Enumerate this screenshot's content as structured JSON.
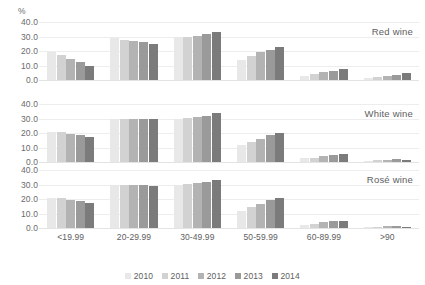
{
  "axis": {
    "unit_label": "%",
    "yticks": [
      "40.0",
      "30.0",
      "20.0",
      "10.0",
      "0.0"
    ],
    "ylim": [
      0,
      40
    ]
  },
  "legend": {
    "position": "bottom-center",
    "entries": [
      {
        "label": "2010",
        "color": "#e8e8e8"
      },
      {
        "label": "2011",
        "color": "#d2d2d2"
      },
      {
        "label": "2012",
        "color": "#b3b3b3"
      },
      {
        "label": "2013",
        "color": "#9a9a9a"
      },
      {
        "label": "2014",
        "color": "#7b7b7b"
      }
    ]
  },
  "panels": [
    {
      "title": "Red wine"
    },
    {
      "title": "White wine"
    },
    {
      "title": "Rosé wine"
    }
  ],
  "chart_data": {
    "type": "bar",
    "title": "",
    "subtitle": "",
    "xlabel": "",
    "ylabel": "%",
    "ylim": [
      0,
      40
    ],
    "yticks": [
      0,
      10,
      20,
      30,
      40
    ],
    "grid": true,
    "legend_position": "bottom-center",
    "categories": [
      "<19.99",
      "20-29.99",
      "30-49.99",
      "50-59.99",
      "60-89.99",
      ">90"
    ],
    "panels": [
      {
        "name": "Red wine",
        "series": [
          {
            "name": "2010",
            "color": "#e8e8e8",
            "values": [
              19.5,
              29.0,
              30.0,
              14.0,
              3.0,
              1.5
            ]
          },
          {
            "name": "2011",
            "color": "#d2d2d2",
            "values": [
              17.0,
              27.5,
              30.0,
              16.5,
              4.0,
              2.0
            ]
          },
          {
            "name": "2012",
            "color": "#b3b3b3",
            "values": [
              14.5,
              27.0,
              30.5,
              19.0,
              5.5,
              2.5
            ]
          },
          {
            "name": "2013",
            "color": "#9a9a9a",
            "values": [
              12.5,
              26.0,
              31.5,
              21.0,
              6.5,
              3.5
            ]
          },
          {
            "name": "2014",
            "color": "#7b7b7b",
            "values": [
              10.0,
              25.0,
              33.0,
              23.0,
              7.5,
              4.5
            ]
          }
        ]
      },
      {
        "name": "White wine",
        "series": [
          {
            "name": "2010",
            "color": "#e8e8e8",
            "values": [
              21.0,
              30.0,
              30.0,
              12.0,
              2.5,
              1.0
            ]
          },
          {
            "name": "2011",
            "color": "#d2d2d2",
            "values": [
              20.5,
              30.0,
              30.5,
              14.0,
              3.0,
              1.2
            ]
          },
          {
            "name": "2012",
            "color": "#b3b3b3",
            "values": [
              19.0,
              30.0,
              31.0,
              16.0,
              4.0,
              1.5
            ]
          },
          {
            "name": "2013",
            "color": "#9a9a9a",
            "values": [
              18.5,
              30.0,
              32.0,
              18.5,
              5.0,
              1.8
            ]
          },
          {
            "name": "2014",
            "color": "#7b7b7b",
            "values": [
              17.5,
              29.5,
              33.5,
              20.0,
              5.5,
              1.2
            ]
          }
        ]
      },
      {
        "name": "Rosé wine",
        "series": [
          {
            "name": "2010",
            "color": "#e8e8e8",
            "values": [
              21.0,
              30.0,
              30.0,
              12.0,
              2.0,
              0.8
            ]
          },
          {
            "name": "2011",
            "color": "#d2d2d2",
            "values": [
              20.5,
              30.0,
              30.5,
              14.5,
              3.0,
              1.0
            ]
          },
          {
            "name": "2012",
            "color": "#b3b3b3",
            "values": [
              19.0,
              30.0,
              31.0,
              16.5,
              4.0,
              1.2
            ]
          },
          {
            "name": "2013",
            "color": "#9a9a9a",
            "values": [
              18.5,
              30.0,
              31.5,
              19.0,
              4.5,
              1.5
            ]
          },
          {
            "name": "2014",
            "color": "#7b7b7b",
            "values": [
              17.5,
              29.0,
              33.0,
              21.0,
              5.0,
              1.0
            ]
          }
        ]
      }
    ]
  }
}
